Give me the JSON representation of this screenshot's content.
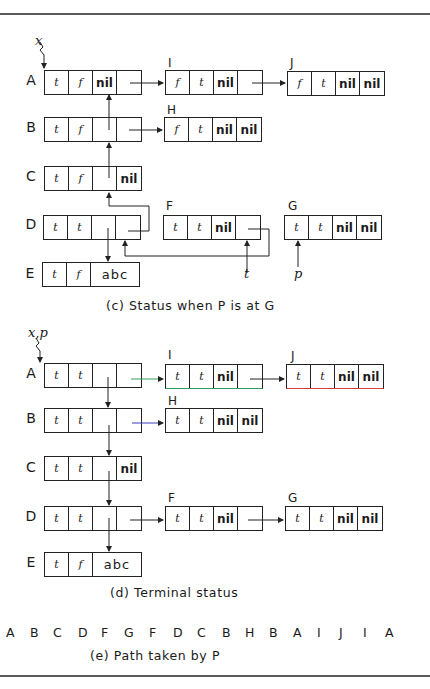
{
  "figure": {
    "panel_c": {
      "caption": "(c)  Status when P is at G",
      "pointer_x_label": "x",
      "pointer_t_label": "t",
      "pointer_p_label": "p",
      "rows": [
        {
          "label": "A",
          "cells": [
            "t",
            "f",
            "nil",
            ""
          ]
        },
        {
          "label": "B",
          "cells": [
            "t",
            "f",
            "",
            ""
          ]
        },
        {
          "label": "C",
          "cells": [
            "t",
            "f",
            "",
            "nil"
          ]
        },
        {
          "label": "D",
          "cells": [
            "t",
            "t",
            "",
            ""
          ]
        },
        {
          "label": "E",
          "cells": [
            "t",
            "f",
            "abc"
          ]
        }
      ],
      "side_nodes": {
        "I": {
          "name": "I",
          "cells": [
            "f",
            "t",
            "nil",
            ""
          ]
        },
        "J": {
          "name": "J",
          "cells": [
            "f",
            "t",
            "nil",
            "nil"
          ]
        },
        "H": {
          "name": "H",
          "cells": [
            "f",
            "t",
            "nil",
            "nil"
          ]
        },
        "F": {
          "name": "F",
          "cells": [
            "t",
            "t",
            "nil",
            ""
          ]
        },
        "G": {
          "name": "G",
          "cells": [
            "t",
            "t",
            "nil",
            "nil"
          ]
        }
      }
    },
    "panel_d": {
      "caption": "(d)  Terminal status",
      "pointer_xp_label": "x,p",
      "rows": [
        {
          "label": "A",
          "cells": [
            "t",
            "t",
            "",
            ""
          ]
        },
        {
          "label": "B",
          "cells": [
            "t",
            "t",
            "",
            ""
          ]
        },
        {
          "label": "C",
          "cells": [
            "t",
            "t",
            "",
            "nil"
          ]
        },
        {
          "label": "D",
          "cells": [
            "t",
            "t",
            "",
            ""
          ]
        },
        {
          "label": "E",
          "cells": [
            "t",
            "f",
            "abc"
          ]
        }
      ],
      "side_nodes": {
        "I": {
          "name": "I",
          "cells": [
            "t",
            "t",
            "nil",
            ""
          ]
        },
        "J": {
          "name": "J",
          "cells": [
            "t",
            "t",
            "nil",
            "nil"
          ]
        },
        "H": {
          "name": "H",
          "cells": [
            "t",
            "t",
            "nil",
            "nil"
          ]
        },
        "F": {
          "name": "F",
          "cells": [
            "t",
            "t",
            "nil",
            ""
          ]
        },
        "G": {
          "name": "G",
          "cells": [
            "t",
            "t",
            "nil",
            "nil"
          ]
        }
      }
    },
    "panel_e": {
      "caption": "(e)  Path taken by P",
      "path": [
        "A",
        "B",
        "C",
        "D",
        "F",
        "G",
        "F",
        "D",
        "C",
        "B",
        "H",
        "B",
        "A",
        "I",
        "J",
        "I",
        "A"
      ]
    },
    "colors": {
      "rule": "#5a5a5a",
      "line": "#222222",
      "highlight_green": "#2e9e5e",
      "highlight_red": "#d04040",
      "highlight_blue": "#3a3ac0"
    }
  }
}
